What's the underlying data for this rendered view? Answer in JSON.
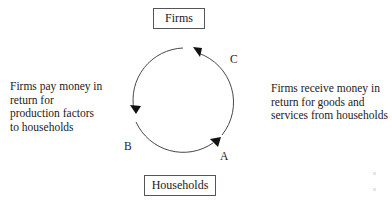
{
  "nodes": {
    "top": "Firms",
    "bottom": "Households"
  },
  "annotations": {
    "left": [
      "Firms pay money in",
      "return for",
      "production factors",
      "to households"
    ],
    "right": [
      "Firms receive money in",
      "return for goods and",
      "services from households"
    ]
  },
  "arrow_labels": {
    "a": "A",
    "b": "B",
    "c": "C"
  },
  "colors": {
    "line": "#333333",
    "text": "#222222",
    "box_border": "#555555"
  }
}
